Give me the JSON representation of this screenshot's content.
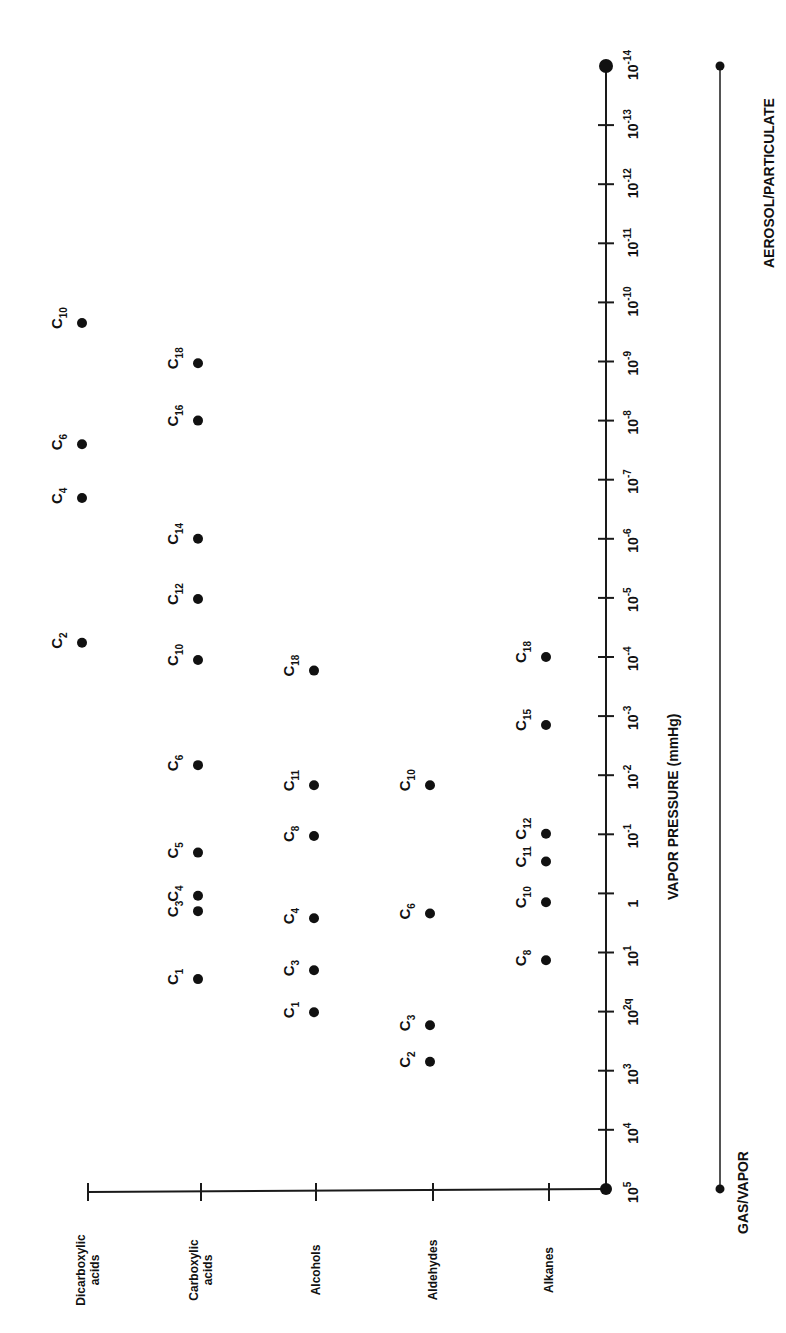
{
  "chart_data": {
    "type": "scatter",
    "orientation": "rotated-90-ccw",
    "title": "",
    "xlabel": "",
    "ylabel": "VAPOR PRESSURE (mmHg)",
    "yscale": "log10",
    "ylim_exponent": [
      5,
      -14
    ],
    "categories": [
      "Dicarboxylic acids",
      "Carboxylic acids",
      "Alcohols",
      "Aldehydes",
      "Alkanes"
    ],
    "y_ticks": [
      {
        "exp": 5,
        "label": "10",
        "sup": "5"
      },
      {
        "exp": 4,
        "label": "10",
        "sup": "4"
      },
      {
        "exp": 3,
        "label": "10",
        "sup": "3"
      },
      {
        "exp": 2,
        "label": "10",
        "sup": "2q"
      },
      {
        "exp": 1,
        "label": "10",
        "sup": "1"
      },
      {
        "exp": 0,
        "label": "1",
        "sup": ""
      },
      {
        "exp": -1,
        "label": "10",
        "sup": "-1"
      },
      {
        "exp": -2,
        "label": "10",
        "sup": "-2"
      },
      {
        "exp": -3,
        "label": "10",
        "sup": "-3"
      },
      {
        "exp": -4,
        "label": "10",
        "sup": "-4"
      },
      {
        "exp": -5,
        "label": "10",
        "sup": "-5"
      },
      {
        "exp": -6,
        "label": "10",
        "sup": "-6"
      },
      {
        "exp": -7,
        "label": "10",
        "sup": "-7"
      },
      {
        "exp": -8,
        "label": "10",
        "sup": "-8"
      },
      {
        "exp": -9,
        "label": "10",
        "sup": "-9"
      },
      {
        "exp": -10,
        "label": "10",
        "sup": "-10"
      },
      {
        "exp": -11,
        "label": "10",
        "sup": "-11"
      },
      {
        "exp": -12,
        "label": "10",
        "sup": "-12"
      },
      {
        "exp": -13,
        "label": "10",
        "sup": "-13"
      },
      {
        "exp": -14,
        "label": "10",
        "sup": "-14"
      }
    ],
    "series": [
      {
        "name": "Dicarboxylic acids",
        "points": [
          {
            "label": "C",
            "sub": "2",
            "log_vp": -4.24
          },
          {
            "label": "C",
            "sub": "4",
            "log_vp": -6.69
          },
          {
            "label": "C",
            "sub": "6",
            "log_vp": -7.6
          },
          {
            "label": "C",
            "sub": "10",
            "log_vp": -9.65
          }
        ]
      },
      {
        "name": "Carboxylic acids",
        "points": [
          {
            "label": "C",
            "sub": "1",
            "log_vp": 1.45
          },
          {
            "label": "C",
            "sub": "3",
            "log_vp": 0.3
          },
          {
            "label": "C",
            "sub": "4",
            "log_vp": 0.04
          },
          {
            "label": "C",
            "sub": "5",
            "log_vp": -0.69
          },
          {
            "label": "C",
            "sub": "6",
            "log_vp": -2.17
          },
          {
            "label": "C",
            "sub": "10",
            "log_vp": -3.95
          },
          {
            "label": "C",
            "sub": "12",
            "log_vp": -4.98
          },
          {
            "label": "C",
            "sub": "14",
            "log_vp": -6.0
          },
          {
            "label": "C",
            "sub": "16",
            "log_vp": -8.0
          },
          {
            "label": "C",
            "sub": "18",
            "log_vp": -8.97
          }
        ]
      },
      {
        "name": "Alcohols",
        "points": [
          {
            "label": "C",
            "sub": "1",
            "log_vp": 2.01
          },
          {
            "label": "C",
            "sub": "3",
            "log_vp": 1.3
          },
          {
            "label": "C",
            "sub": "4",
            "log_vp": 0.42
          },
          {
            "label": "C",
            "sub": "8",
            "log_vp": -0.97
          },
          {
            "label": "C",
            "sub": "11",
            "log_vp": -1.83
          },
          {
            "label": "C",
            "sub": "18",
            "log_vp": -3.77
          }
        ]
      },
      {
        "name": "Aldehydes",
        "points": [
          {
            "label": "C",
            "sub": "2",
            "log_vp": 2.85
          },
          {
            "label": "C",
            "sub": "3",
            "log_vp": 2.23
          },
          {
            "label": "C",
            "sub": "6",
            "log_vp": 0.34
          },
          {
            "label": "C",
            "sub": "10",
            "log_vp": -1.83
          }
        ]
      },
      {
        "name": "Alkanes",
        "points": [
          {
            "label": "C",
            "sub": "8",
            "log_vp": 1.13
          },
          {
            "label": "C",
            "sub": "10",
            "log_vp": 0.15
          },
          {
            "label": "C",
            "sub": "11",
            "log_vp": -0.54
          },
          {
            "label": "C",
            "sub": "12",
            "log_vp": -1.01
          },
          {
            "label": "C",
            "sub": "15",
            "log_vp": -2.85
          },
          {
            "label": "C",
            "sub": "18",
            "log_vp": -4.0
          }
        ]
      }
    ],
    "phase_bar": {
      "left_label": "GAS/VAPOR",
      "right_label": "AEROSOL/PARTICULATE",
      "from_exp": 5,
      "to_exp": -14
    },
    "grid": false,
    "legend": "none"
  },
  "labels": {
    "axis_title": "VAPOR PRESSURE (mmHg)",
    "gas_vapor": "GAS/VAPOR",
    "aerosol": "AEROSOL/PARTICULATE",
    "categories": {
      "dicarboxylic": [
        "Dicarboxylic",
        "acids"
      ],
      "carboxylic": [
        "Carboxylic",
        "acids"
      ],
      "alcohols": [
        "Alcohols"
      ],
      "aldehydes": [
        "Aldehydes"
      ],
      "alkanes": [
        "Alkanes"
      ]
    }
  },
  "colors": {
    "ink": "#111111",
    "background": "#ffffff"
  }
}
